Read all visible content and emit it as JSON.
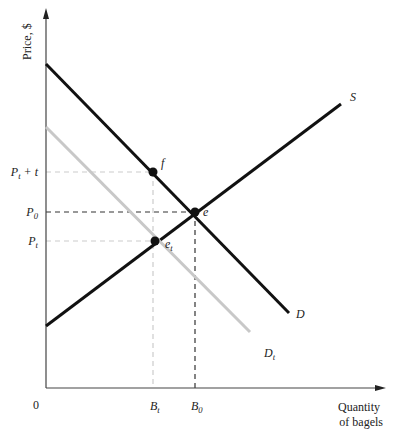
{
  "chart_data": {
    "type": "line",
    "title": "",
    "xlabel": "Quantity of bagels",
    "xlabel_lines": [
      "Quantity",
      "of bagels"
    ],
    "ylabel": "Price, $",
    "origin_label": "0",
    "grid": false,
    "legend": "none (curves labeled inline)",
    "x_ticks": [
      {
        "label": "B",
        "sub": "t",
        "x_px": 155
      },
      {
        "label": "B",
        "sub": "0",
        "x_px": 196
      }
    ],
    "y_ticks": [
      {
        "label": "P",
        "sub": "t",
        "suffix": " + t",
        "y_px": 172
      },
      {
        "label": "P",
        "sub": "0",
        "suffix": "",
        "y_px": 212
      },
      {
        "label": "P",
        "sub": "t",
        "suffix": "",
        "y_px": 241
      }
    ],
    "series": [
      {
        "name": "D",
        "label": "D",
        "color": "#111111",
        "width": 3,
        "points_px": [
          [
            46,
            64
          ],
          [
            289,
            313
          ]
        ],
        "label_pos_px": [
          296,
          318
        ]
      },
      {
        "name": "S",
        "label": "S",
        "color": "#111111",
        "width": 3,
        "points_px": [
          [
            46,
            326
          ],
          [
            341,
            104
          ]
        ],
        "label_pos_px": [
          350,
          101
        ]
      },
      {
        "name": "D_t",
        "label": "D",
        "label_sub": "t",
        "color": "#c8c8c8",
        "width": 3,
        "points_px": [
          [
            46,
            127
          ],
          [
            250,
            332
          ]
        ],
        "label_pos_px": [
          264,
          357
        ]
      }
    ],
    "points": [
      {
        "name": "e",
        "label": "e",
        "x_px": 195,
        "y_px": 212,
        "label_pos_px": [
          203,
          216
        ]
      },
      {
        "name": "f",
        "label": "f",
        "x_px": 153,
        "y_px": 172,
        "label_pos_px": [
          161,
          167
        ]
      },
      {
        "name": "e_t",
        "label": "e",
        "label_sub": "t",
        "x_px": 155,
        "y_px": 241,
        "label_pos_px": [
          165,
          248
        ]
      }
    ],
    "guides": [
      {
        "from": [
          46,
          172
        ],
        "to": [
          153,
          172
        ],
        "color": "#cccccc"
      },
      {
        "from": [
          153,
          172
        ],
        "to": [
          153,
          388
        ],
        "color": "#cccccc"
      },
      {
        "from": [
          46,
          212
        ],
        "to": [
          195,
          212
        ],
        "color": "#333333"
      },
      {
        "from": [
          195,
          212
        ],
        "to": [
          195,
          388
        ],
        "color": "#333333"
      },
      {
        "from": [
          46,
          241
        ],
        "to": [
          155,
          241
        ],
        "color": "#cccccc"
      }
    ],
    "axes": {
      "origin_px": [
        46,
        388
      ],
      "x_end_px": 384,
      "y_end_px": 10
    }
  }
}
